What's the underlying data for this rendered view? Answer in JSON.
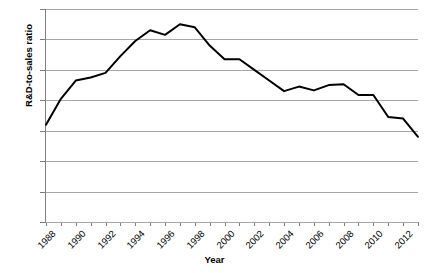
{
  "chart_data": {
    "type": "line",
    "title": "",
    "xlabel": "Year",
    "ylabel": "R&D-to-sales ratio",
    "x": [
      1988,
      1989,
      1990,
      1991,
      1992,
      1993,
      1994,
      1995,
      1996,
      1997,
      1998,
      1999,
      2000,
      2001,
      2002,
      2003,
      2004,
      2005,
      2006,
      2007,
      2008,
      2009,
      2010,
      2011,
      2012,
      2013
    ],
    "values": [
      6.4,
      8.1,
      9.3,
      9.5,
      9.8,
      10.9,
      11.9,
      12.6,
      12.3,
      13.0,
      12.8,
      11.6,
      10.7,
      10.7,
      10.0,
      9.3,
      8.6,
      8.9,
      8.65,
      9.0,
      9.05,
      8.35,
      8.35,
      6.9,
      6.8,
      5.6
    ],
    "series": [
      {
        "name": "R&D-to-sales ratio",
        "color": "#000000",
        "values": [
          6.4,
          8.1,
          9.3,
          9.5,
          9.8,
          10.9,
          11.9,
          12.6,
          12.3,
          13.0,
          12.8,
          11.6,
          10.7,
          10.7,
          10.0,
          9.3,
          8.6,
          8.9,
          8.65,
          9.0,
          9.05,
          8.35,
          8.35,
          6.9,
          6.8,
          5.6
        ]
      }
    ],
    "xlim": [
      1988,
      2013
    ],
    "ylim": [
      0,
      14
    ],
    "yticks": [
      0,
      2,
      4,
      6,
      8,
      10,
      12,
      14
    ],
    "ytick_labels": [
      "0",
      "2",
      "4",
      "6",
      "8",
      "10",
      "12",
      "14"
    ],
    "xticks": [
      1988,
      1989,
      1990,
      1991,
      1992,
      1993,
      1994,
      1995,
      1996,
      1997,
      1998,
      1999,
      2000,
      2001,
      2002,
      2003,
      2004,
      2005,
      2006,
      2007,
      2008,
      2009,
      2010,
      2011,
      2012,
      2013
    ],
    "xtick_labels": [
      "1988",
      "",
      "1990",
      "",
      "1992",
      "",
      "1994",
      "",
      "1996",
      "",
      "1998",
      "",
      "2000",
      "",
      "2002",
      "",
      "2004",
      "",
      "2006",
      "",
      "2008",
      "",
      "2010",
      "",
      "2012",
      ""
    ],
    "grid": {
      "horizontal": true,
      "vertical": false,
      "color": "#a6a6a6"
    },
    "legend": {
      "visible": false,
      "position": "none"
    },
    "line_width": 2,
    "markers": false,
    "background": "#ffffff",
    "axis_color": "#7f7f7f"
  }
}
